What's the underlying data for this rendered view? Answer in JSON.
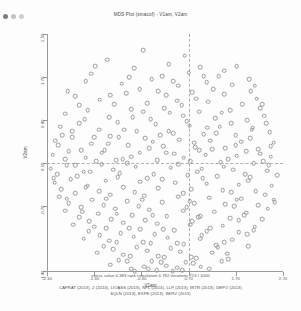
{
  "window": {
    "title": "MDS Plot (smacof) - V1am, V2am",
    "controls": [
      "close-dot",
      "minimize-dot",
      "maximize-dot"
    ]
  },
  "chart_data": {
    "type": "scatter",
    "title": "MDS Plot (smacof) - V1am, V2am",
    "xlabel": "V1am",
    "ylabel": "V2am",
    "xlim": [
      -2.3,
      2.7
    ],
    "ylim": [
      -1.9,
      2.5
    ],
    "xticks": [
      "-2.30",
      "-1.30",
      "-0.30",
      "0.70",
      "1.70",
      "2.70"
    ],
    "xtick_values": [
      -2.3,
      -1.3,
      -0.3,
      0.7,
      1.7,
      2.7
    ],
    "yticks": [
      "2.50",
      "1.70",
      "0.90",
      "0.10",
      "-0.70",
      "-1.90"
    ],
    "ytick_values": [
      2.5,
      1.7,
      0.9,
      0.1,
      -0.7,
      -1.9
    ],
    "grid": false,
    "legend": "none",
    "reference_lines": {
      "vertical_x": 0.7,
      "horizontal_y": 0.1,
      "style": "dashed"
    },
    "marker": {
      "shape": "open-circle",
      "color": "#9b9b9b",
      "size": 2.6
    },
    "points": [
      [
        -1.02,
        2.02
      ],
      [
        -0.45,
        1.86
      ],
      [
        0.28,
        1.94
      ],
      [
        0.62,
        2.1
      ],
      [
        0.95,
        1.88
      ],
      [
        1.34,
        1.72
      ],
      [
        -1.48,
        1.62
      ],
      [
        -0.72,
        1.58
      ],
      [
        -0.08,
        1.66
      ],
      [
        0.48,
        1.54
      ],
      [
        0.7,
        1.78
      ],
      [
        1.08,
        1.6
      ],
      [
        1.62,
        1.56
      ],
      [
        2.02,
        1.44
      ],
      [
        -1.7,
        1.34
      ],
      [
        -1.18,
        1.28
      ],
      [
        -0.62,
        1.4
      ],
      [
        -0.18,
        1.22
      ],
      [
        0.22,
        1.36
      ],
      [
        0.55,
        1.18
      ],
      [
        0.78,
        1.42
      ],
      [
        1.12,
        1.24
      ],
      [
        1.46,
        1.38
      ],
      [
        1.84,
        1.2
      ],
      [
        2.22,
        1.12
      ],
      [
        -1.92,
        1.02
      ],
      [
        -1.44,
        1.08
      ],
      [
        -0.98,
        0.96
      ],
      [
        -0.52,
        1.1
      ],
      [
        -0.1,
        0.92
      ],
      [
        0.3,
        1.04
      ],
      [
        0.66,
        0.88
      ],
      [
        0.92,
        1.06
      ],
      [
        1.26,
        0.94
      ],
      [
        1.58,
        1.08
      ],
      [
        1.94,
        0.9
      ],
      [
        2.3,
        0.98
      ],
      [
        -2.02,
        0.78
      ],
      [
        -1.62,
        0.84
      ],
      [
        -1.2,
        0.72
      ],
      [
        -0.8,
        0.86
      ],
      [
        -0.4,
        0.7
      ],
      [
        0.0,
        0.82
      ],
      [
        0.38,
        0.66
      ],
      [
        0.72,
        0.8
      ],
      [
        1.02,
        0.64
      ],
      [
        1.36,
        0.78
      ],
      [
        1.7,
        0.62
      ],
      [
        2.06,
        0.76
      ],
      [
        2.42,
        0.68
      ],
      [
        -2.12,
        0.52
      ],
      [
        -1.76,
        0.58
      ],
      [
        -1.36,
        0.46
      ],
      [
        -0.96,
        0.6
      ],
      [
        -0.58,
        0.44
      ],
      [
        -0.22,
        0.56
      ],
      [
        0.16,
        0.42
      ],
      [
        0.5,
        0.54
      ],
      [
        0.84,
        0.4
      ],
      [
        1.16,
        0.52
      ],
      [
        1.48,
        0.38
      ],
      [
        1.82,
        0.5
      ],
      [
        2.18,
        0.36
      ],
      [
        2.5,
        0.48
      ],
      [
        -2.18,
        0.26
      ],
      [
        -1.84,
        0.32
      ],
      [
        -1.48,
        0.2
      ],
      [
        -1.08,
        0.34
      ],
      [
        -0.7,
        0.18
      ],
      [
        -0.34,
        0.3
      ],
      [
        0.04,
        0.16
      ],
      [
        0.4,
        0.28
      ],
      [
        0.74,
        0.14
      ],
      [
        1.06,
        0.26
      ],
      [
        1.38,
        0.12
      ],
      [
        1.72,
        0.24
      ],
      [
        2.08,
        0.1
      ],
      [
        2.44,
        0.22
      ],
      [
        -2.22,
        0.0
      ],
      [
        -1.88,
        0.06
      ],
      [
        -1.52,
        -0.06
      ],
      [
        -1.14,
        0.08
      ],
      [
        -0.76,
        -0.08
      ],
      [
        -0.42,
        0.04
      ],
      [
        -0.04,
        -0.1
      ],
      [
        0.32,
        0.02
      ],
      [
        0.68,
        -0.12
      ],
      [
        0.98,
        0.0
      ],
      [
        1.3,
        -0.14
      ],
      [
        1.64,
        -0.02
      ],
      [
        2.0,
        -0.16
      ],
      [
        2.36,
        -0.04
      ],
      [
        2.58,
        -0.12
      ],
      [
        -2.14,
        -0.26
      ],
      [
        -1.8,
        -0.2
      ],
      [
        -1.44,
        -0.32
      ],
      [
        -1.06,
        -0.22
      ],
      [
        -0.68,
        -0.34
      ],
      [
        -0.32,
        -0.24
      ],
      [
        0.06,
        -0.36
      ],
      [
        0.42,
        -0.26
      ],
      [
        0.76,
        -0.38
      ],
      [
        1.08,
        -0.28
      ],
      [
        1.42,
        -0.4
      ],
      [
        1.76,
        -0.3
      ],
      [
        2.12,
        -0.42
      ],
      [
        2.46,
        -0.32
      ],
      [
        -2.04,
        -0.52
      ],
      [
        -1.7,
        -0.46
      ],
      [
        -1.34,
        -0.58
      ],
      [
        -0.96,
        -0.48
      ],
      [
        -0.6,
        -0.6
      ],
      [
        -0.24,
        -0.5
      ],
      [
        0.14,
        -0.62
      ],
      [
        0.48,
        -0.52
      ],
      [
        0.82,
        -0.64
      ],
      [
        1.14,
        -0.54
      ],
      [
        1.48,
        -0.66
      ],
      [
        1.82,
        -0.56
      ],
      [
        2.18,
        -0.68
      ],
      [
        2.5,
        -0.58
      ],
      [
        -1.92,
        -0.78
      ],
      [
        -1.58,
        -0.72
      ],
      [
        -1.22,
        -0.84
      ],
      [
        -0.86,
        -0.74
      ],
      [
        -0.5,
        -0.86
      ],
      [
        -0.14,
        -0.76
      ],
      [
        0.24,
        -0.88
      ],
      [
        0.58,
        -0.78
      ],
      [
        0.9,
        -0.9
      ],
      [
        1.24,
        -0.8
      ],
      [
        1.58,
        -0.92
      ],
      [
        1.92,
        -0.82
      ],
      [
        2.26,
        -0.94
      ],
      [
        -1.74,
        -1.04
      ],
      [
        -1.4,
        -0.98
      ],
      [
        -1.04,
        -1.1
      ],
      [
        -0.68,
        -1.0
      ],
      [
        -0.32,
        -1.12
      ],
      [
        0.04,
        -1.02
      ],
      [
        0.4,
        -1.14
      ],
      [
        0.74,
        -1.04
      ],
      [
        1.08,
        -1.16
      ],
      [
        1.42,
        -1.06
      ],
      [
        1.76,
        -1.18
      ],
      [
        2.1,
        -1.08
      ],
      [
        -1.52,
        -1.3
      ],
      [
        -1.18,
        -1.24
      ],
      [
        -0.82,
        -1.36
      ],
      [
        -0.46,
        -1.26
      ],
      [
        -0.1,
        -1.38
      ],
      [
        0.26,
        -1.28
      ],
      [
        0.6,
        -1.4
      ],
      [
        0.94,
        -1.3
      ],
      [
        1.28,
        -1.42
      ],
      [
        1.62,
        -1.32
      ],
      [
        1.96,
        -1.44
      ],
      [
        -1.24,
        -1.56
      ],
      [
        -0.9,
        -1.5
      ],
      [
        -0.54,
        -1.62
      ],
      [
        -0.18,
        -1.52
      ],
      [
        0.18,
        -1.64
      ],
      [
        0.52,
        -1.54
      ],
      [
        0.86,
        -1.66
      ],
      [
        1.2,
        -1.56
      ],
      [
        1.54,
        -1.68
      ],
      [
        -0.96,
        -1.78
      ],
      [
        -0.6,
        -1.72
      ],
      [
        -0.24,
        -1.82
      ],
      [
        0.12,
        -1.74
      ],
      [
        0.46,
        -1.84
      ],
      [
        0.8,
        -1.76
      ],
      [
        1.14,
        -1.86
      ],
      [
        -0.44,
        -1.9
      ],
      [
        0.02,
        -1.88
      ],
      [
        0.36,
        -1.9
      ],
      [
        -1.28,
        1.9
      ],
      [
        -0.26,
        2.2
      ],
      [
        0.14,
        1.72
      ],
      [
        1.72,
        1.9
      ],
      [
        -1.62,
        1.18
      ],
      [
        -0.34,
        1.48
      ],
      [
        0.86,
        1.3
      ],
      [
        1.98,
        1.66
      ],
      [
        -1.98,
        0.62
      ],
      [
        -0.88,
        1.2
      ],
      [
        0.18,
        1.12
      ],
      [
        1.22,
        1.48
      ],
      [
        2.14,
        1.3
      ],
      [
        -1.3,
        0.58
      ],
      [
        -0.48,
        0.96
      ],
      [
        0.58,
        0.98
      ],
      [
        1.6,
        0.84
      ],
      [
        2.34,
        0.84
      ],
      [
        -1.58,
        0.34
      ],
      [
        -0.66,
        0.72
      ],
      [
        0.28,
        0.7
      ],
      [
        1.28,
        0.66
      ],
      [
        2.0,
        0.56
      ],
      [
        -1.92,
        0.18
      ],
      [
        -1.0,
        0.46
      ],
      [
        -0.14,
        0.38
      ],
      [
        0.92,
        0.34
      ],
      [
        1.92,
        0.32
      ],
      [
        -2.08,
        -0.1
      ],
      [
        -1.26,
        0.14
      ],
      [
        -0.52,
        0.22
      ],
      [
        0.6,
        0.2
      ],
      [
        1.54,
        0.18
      ],
      [
        2.28,
        0.14
      ],
      [
        -1.66,
        -0.14
      ],
      [
        -0.9,
        -0.02
      ],
      [
        -0.18,
        -0.18
      ],
      [
        0.88,
        -0.06
      ],
      [
        1.9,
        -0.1
      ],
      [
        -2.0,
        -0.38
      ],
      [
        -1.2,
        -0.42
      ],
      [
        -0.44,
        -0.44
      ],
      [
        0.58,
        -0.46
      ],
      [
        1.6,
        -0.44
      ],
      [
        2.32,
        -0.48
      ],
      [
        -1.84,
        -0.64
      ],
      [
        -1.1,
        -0.68
      ],
      [
        -0.36,
        -0.7
      ],
      [
        0.66,
        -0.72
      ],
      [
        1.66,
        -0.7
      ],
      [
        2.38,
        -0.74
      ],
      [
        -1.62,
        -0.9
      ],
      [
        -0.94,
        -0.94
      ],
      [
        -0.22,
        -0.96
      ],
      [
        0.78,
        -0.98
      ],
      [
        1.76,
        -0.96
      ],
      [
        -1.42,
        -1.16
      ],
      [
        -0.74,
        -1.2
      ],
      [
        -0.02,
        -1.22
      ],
      [
        0.98,
        -1.24
      ],
      [
        1.94,
        -1.22
      ],
      [
        -1.1,
        -1.44
      ],
      [
        -0.4,
        -1.46
      ],
      [
        0.32,
        -1.48
      ],
      [
        1.32,
        -1.46
      ],
      [
        -0.78,
        -1.7
      ],
      [
        -0.08,
        -1.72
      ],
      [
        0.64,
        -1.74
      ],
      [
        1.4,
        -1.72
      ],
      [
        -0.52,
        -1.86
      ],
      [
        0.22,
        -1.8
      ],
      [
        0.96,
        -1.82
      ],
      [
        -1.36,
        1.76
      ],
      [
        -0.56,
        1.7
      ],
      [
        0.38,
        1.62
      ],
      [
        1.46,
        1.82
      ],
      [
        -1.86,
        1.44
      ],
      [
        -0.96,
        1.36
      ],
      [
        0.06,
        1.44
      ],
      [
        1.02,
        1.72
      ],
      [
        2.1,
        1.54
      ],
      [
        -1.5,
        0.92
      ],
      [
        -0.26,
        1.06
      ],
      [
        0.46,
        1.26
      ],
      [
        1.4,
        1.04
      ],
      [
        2.26,
        1.2
      ],
      [
        -1.76,
        0.7
      ],
      [
        -0.78,
        0.58
      ],
      [
        0.1,
        0.62
      ],
      [
        1.1,
        0.76
      ],
      [
        2.04,
        0.72
      ],
      [
        -2.06,
        0.44
      ],
      [
        -1.14,
        0.3
      ],
      [
        -0.06,
        0.5
      ],
      [
        0.82,
        0.48
      ],
      [
        1.7,
        0.44
      ],
      [
        2.44,
        0.42
      ],
      [
        -1.7,
        0.06
      ],
      [
        -0.84,
        0.16
      ],
      [
        0.22,
        0.3
      ],
      [
        1.2,
        0.36
      ],
      [
        2.22,
        0.28
      ],
      [
        -2.16,
        -0.18
      ],
      [
        -1.38,
        -0.06
      ],
      [
        -0.6,
        0.1
      ],
      [
        0.48,
        0.08
      ],
      [
        1.44,
        0.04
      ],
      [
        2.4,
        0.06
      ],
      [
        -1.48,
        -0.34
      ],
      [
        -0.8,
        -0.16
      ],
      [
        0.14,
        -0.2
      ],
      [
        1.0,
        -0.18
      ],
      [
        1.96,
        -0.22
      ],
      [
        -1.88,
        -0.56
      ],
      [
        -1.04,
        -0.56
      ],
      [
        -0.28,
        -0.58
      ],
      [
        0.72,
        -0.6
      ],
      [
        1.72,
        -0.58
      ],
      [
        2.52,
        -0.62
      ],
      [
        -1.56,
        -0.8
      ],
      [
        -0.82,
        -0.84
      ],
      [
        -0.06,
        -0.86
      ],
      [
        0.94,
        -0.88
      ],
      [
        1.88,
        -0.86
      ],
      [
        -1.3,
        -1.08
      ],
      [
        -0.56,
        -1.1
      ],
      [
        0.16,
        -1.12
      ],
      [
        1.16,
        -1.1
      ],
      [
        2.08,
        -1.14
      ],
      [
        -0.98,
        -1.34
      ],
      [
        -0.26,
        -1.36
      ],
      [
        0.46,
        -1.38
      ],
      [
        1.46,
        -1.36
      ],
      [
        -0.68,
        -1.6
      ],
      [
        0.06,
        -1.62
      ],
      [
        0.76,
        -1.64
      ],
      [
        1.52,
        -1.58
      ],
      [
        -0.16,
        -1.86
      ],
      [
        0.56,
        -1.88
      ]
    ],
    "annotations": {
      "stress_label": "stress value",
      "stress_value": "0.383",
      "correlation_label": "rank correlation",
      "correlation_value": "0.782",
      "iterations_label": "iterations",
      "iterations_value": "713 / 1000"
    }
  },
  "footer": {
    "statline": "stress value  0.383   rank correlation  0.782  iterations  713  /  1000",
    "variables_line1": "CAPRAT (2013), 2 (2013), LIOASS (2013), NPL (2013), LLP (2013), INTR (2013), DEPO (2013)",
    "variables_line2": "SQLN (2013), EXPE (2013), SERV (2013)"
  }
}
